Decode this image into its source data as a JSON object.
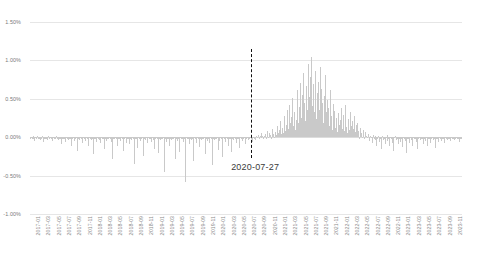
{
  "chart_data": {
    "type": "bar",
    "title": "",
    "xlabel": "",
    "ylabel": "",
    "ylim": [
      -1.0,
      1.5
    ],
    "ytick_labels": [
      "1.50%",
      "1.00%",
      "0.50%",
      "0.00%",
      "-0.50%",
      "-1.00%"
    ],
    "ytick_values": [
      1.5,
      1.0,
      0.5,
      0.0,
      -0.5,
      -1.0
    ],
    "grid": true,
    "legend": null,
    "bar_color": "#c9c9c9",
    "gridline_color": "#e6e6e6",
    "annotations": [
      {
        "name": "event-marker",
        "label": "2020-07-27",
        "x": "2020-07-27",
        "line_style": "dashed",
        "line_color": "#111111",
        "y_from": 1.15,
        "y_to": -0.27
      }
    ],
    "x_tick_labels": [
      "2017-01",
      "2017-03",
      "2017-05",
      "2017-07",
      "2017-09",
      "2017-11",
      "2018-01",
      "2018-03",
      "2018-05",
      "2018-07",
      "2018-09",
      "2018-11",
      "2019-01",
      "2019-03",
      "2019-05",
      "2019-07",
      "2019-09",
      "2019-11",
      "2020-01",
      "2020-03",
      "2020-05",
      "2020-07",
      "2020-09",
      "2020-11",
      "2021-01",
      "2021-03",
      "2021-05",
      "2021-07",
      "2021-09",
      "2021-11",
      "2022-01",
      "2022-03",
      "2022-05",
      "2022-07",
      "2022-09",
      "2022-11",
      "2023-01",
      "2023-03",
      "2023-05",
      "2023-07",
      "2023-09",
      "2023-11"
    ],
    "x_range": [
      "2017-01",
      "2023-12"
    ],
    "values": [
      -0.02,
      -0.01,
      -0.03,
      0.01,
      -0.02,
      -0.05,
      -0.01,
      -0.02,
      0.02,
      -0.03,
      -0.01,
      -0.02,
      -0.04,
      -0.02,
      0.01,
      -0.06,
      -0.02,
      -0.03,
      -0.01,
      -0.02,
      -0.04,
      0.01,
      -0.02,
      -0.01,
      -0.03,
      -0.02,
      -0.05,
      -0.01,
      -0.02,
      -0.03,
      0.01,
      -0.02,
      -0.01,
      -0.04,
      -0.02,
      -0.03,
      -0.09,
      -0.02,
      -0.01,
      -0.03,
      -0.02,
      -0.06,
      -0.01,
      -0.02,
      -0.04,
      -0.01,
      -0.03,
      -0.02,
      -0.12,
      -0.02,
      -0.01,
      -0.05,
      -0.02,
      -0.03,
      -0.01,
      -0.18,
      -0.02,
      -0.04,
      -0.01,
      -0.03,
      -0.02,
      -0.07,
      -0.01,
      -0.02,
      -0.05,
      -0.01,
      -0.03,
      -0.02,
      -0.11,
      -0.01,
      -0.02,
      -0.04,
      -0.02,
      -0.22,
      -0.01,
      -0.03,
      -0.02,
      -0.06,
      -0.01,
      -0.02,
      -0.04,
      -0.02,
      -0.08,
      -0.01,
      -0.03,
      -0.02,
      -0.15,
      -0.01,
      -0.02,
      -0.05,
      -0.02,
      -0.03,
      -0.01,
      -0.02,
      -0.06,
      -0.01,
      -0.29,
      -0.02,
      -0.03,
      -0.01,
      -0.02,
      -0.12,
      -0.01,
      -0.03,
      -0.02,
      -0.05,
      -0.01,
      -0.02,
      -0.04,
      -0.18,
      -0.02,
      -0.01,
      -0.07,
      -0.02,
      -0.03,
      -0.01,
      -0.09,
      -0.02,
      -0.04,
      -0.01,
      -0.02,
      -0.35,
      -0.01,
      -0.03,
      -0.02,
      -0.14,
      -0.01,
      -0.02,
      -0.05,
      -0.02,
      -0.03,
      -0.01,
      -0.24,
      -0.02,
      -0.04,
      -0.01,
      -0.02,
      -0.08,
      -0.01,
      -0.03,
      -0.02,
      -0.06,
      -0.01,
      -0.02,
      -0.04,
      -0.16,
      -0.02,
      -0.01,
      -0.03,
      -0.21,
      -0.02,
      -0.01,
      -0.04,
      -0.02,
      -0.03,
      -0.01,
      -0.45,
      -0.02,
      -0.01,
      -0.06,
      -0.02,
      -0.03,
      -0.11,
      -0.02,
      -0.01,
      -0.04,
      -0.02,
      -0.03,
      -0.01,
      -0.28,
      -0.02,
      -0.05,
      -0.01,
      -0.02,
      -0.19,
      -0.01,
      -0.03,
      -0.02,
      -0.06,
      -0.01,
      -0.02,
      -0.58,
      -0.01,
      -0.03,
      -0.02,
      -0.09,
      -0.01,
      -0.02,
      -0.04,
      -0.02,
      -0.31,
      -0.01,
      -0.03,
      -0.02,
      -0.07,
      -0.01,
      -0.02,
      -0.13,
      -0.02,
      -0.01,
      -0.04,
      -0.02,
      -0.03,
      -0.01,
      -0.22,
      -0.02,
      -0.05,
      -0.01,
      -0.02,
      -0.08,
      -0.01,
      -0.03,
      -0.36,
      -0.02,
      -0.01,
      -0.04,
      -0.02,
      -0.03,
      -0.01,
      -0.17,
      -0.02,
      -0.05,
      -0.01,
      -0.02,
      -0.26,
      -0.01,
      -0.03,
      -0.02,
      -0.06,
      -0.01,
      -0.02,
      -0.11,
      -0.02,
      -0.03,
      -0.01,
      -0.19,
      -0.02,
      -0.04,
      -0.01,
      -0.02,
      -0.07,
      -0.01,
      -0.03,
      -0.02,
      -0.14,
      -0.01,
      -0.02,
      -0.05,
      -0.02,
      -0.03,
      -0.01,
      -0.09,
      -0.02,
      -0.01,
      -0.04,
      -0.02,
      -0.03,
      -0.01,
      -0.02,
      -0.06,
      -0.01,
      -0.02,
      -0.04,
      -0.01,
      0.02,
      -0.01,
      0.03,
      -0.02,
      0.01,
      0.05,
      -0.01,
      0.02,
      -0.03,
      0.01,
      0.04,
      -0.02,
      0.08,
      0.02,
      -0.01,
      0.06,
      0.03,
      -0.02,
      0.11,
      0.04,
      0.02,
      -0.01,
      0.07,
      0.03,
      0.15,
      0.05,
      0.02,
      0.09,
      0.21,
      0.04,
      0.12,
      0.06,
      0.28,
      0.08,
      0.03,
      0.16,
      0.35,
      0.11,
      0.42,
      0.19,
      0.07,
      0.26,
      0.51,
      0.14,
      0.33,
      0.09,
      0.22,
      0.46,
      0.62,
      0.18,
      0.39,
      0.71,
      0.25,
      0.55,
      0.31,
      0.83,
      0.44,
      0.21,
      0.67,
      0.36,
      0.95,
      0.52,
      0.28,
      0.78,
      1.04,
      0.41,
      0.69,
      0.33,
      0.86,
      0.47,
      0.24,
      0.58,
      0.72,
      0.36,
      0.91,
      0.29,
      0.63,
      0.44,
      0.18,
      0.54,
      0.81,
      0.33,
      0.22,
      0.49,
      0.38,
      0.15,
      0.61,
      0.27,
      0.09,
      0.43,
      0.19,
      0.34,
      0.12,
      0.25,
      0.07,
      0.31,
      0.16,
      0.05,
      0.23,
      0.38,
      0.11,
      0.29,
      0.08,
      0.18,
      0.42,
      0.13,
      0.06,
      0.24,
      0.09,
      0.33,
      0.15,
      0.04,
      0.21,
      0.11,
      0.27,
      0.07,
      0.16,
      0.03,
      0.19,
      0.08,
      -0.02,
      0.12,
      0.05,
      -0.01,
      0.09,
      0.03,
      -0.03,
      0.07,
      0.02,
      -0.01,
      0.04,
      -0.02,
      -0.05,
      0.02,
      -0.01,
      -0.08,
      0.03,
      -0.02,
      -0.04,
      0.01,
      -0.11,
      -0.02,
      0.02,
      -0.06,
      -0.03,
      -0.01,
      -0.15,
      0.02,
      -0.04,
      -0.02,
      -0.09,
      -0.01,
      0.03,
      -0.05,
      -0.02,
      -0.12,
      -0.01,
      -0.03,
      -0.07,
      -0.02,
      -0.18,
      -0.01,
      0.02,
      -0.04,
      -0.02,
      -0.09,
      -0.01,
      -0.03,
      -0.06,
      -0.02,
      -0.13,
      -0.01,
      -0.02,
      -0.05,
      -0.01,
      -0.21,
      -0.02,
      -0.03,
      -0.08,
      -0.01,
      -0.02,
      -0.04,
      -0.11,
      -0.01,
      -0.03,
      -0.02,
      -0.06,
      -0.01,
      -0.16,
      -0.02,
      -0.01,
      -0.04,
      -0.02,
      -0.03,
      -0.09,
      -0.01,
      -0.02,
      -0.05,
      -0.01,
      -0.12,
      -0.02,
      -0.03,
      -0.01,
      -0.07,
      -0.02,
      -0.01,
      -0.04,
      -0.02,
      -0.14,
      -0.01,
      -0.03,
      -0.02,
      -0.06,
      -0.01,
      -0.02,
      -0.05,
      -0.01,
      -0.03,
      -0.02,
      -0.08,
      -0.01,
      -0.02,
      -0.04,
      -0.01,
      -0.03,
      -0.02,
      -0.05,
      -0.01,
      -0.02,
      -0.03,
      -0.01,
      -0.04,
      -0.02,
      -0.01,
      -0.03,
      -0.02,
      -0.06,
      -0.01,
      -0.02,
      -0.03
    ]
  }
}
